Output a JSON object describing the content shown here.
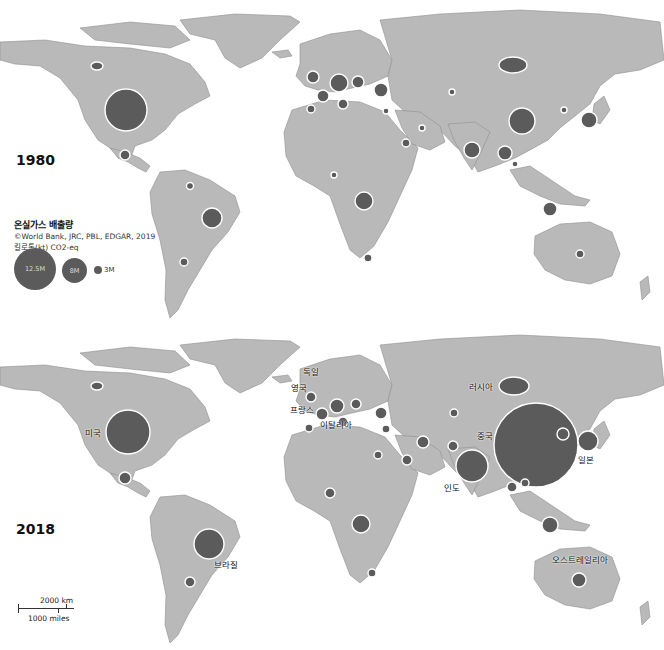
{
  "panels": [
    {
      "year": "1980",
      "position": "top"
    },
    {
      "year": "2018",
      "position": "bottom"
    }
  ],
  "legend": {
    "title": "온실가스 배출량",
    "source": "©World Bank, JRC, PBL, EDGAR, 2019",
    "unit": "킬로톤(kt) CO2-eq",
    "sizes": [
      "12.5M",
      "8M",
      "3M"
    ]
  },
  "scale_bar": {
    "km": "2000 km",
    "miles": "1000 miles"
  },
  "country_labels_2018": {
    "usa": "미국",
    "brazil": "브라질",
    "germany": "독일",
    "uk": "영국",
    "france": "프랑스",
    "italy": "이탈리아",
    "russia": "러시아",
    "china": "중국",
    "india": "인도",
    "japan": "일본",
    "australia": "오스트레일리아"
  },
  "colors": {
    "land": "#b9b9b9",
    "bubble": "#5b5b5b",
    "background": "#ffffff"
  }
}
